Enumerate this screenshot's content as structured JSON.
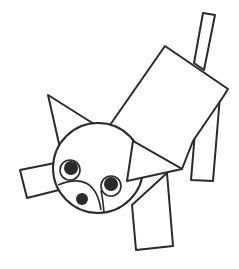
{
  "figure": {
    "colors": {
      "stroke": "#2b2b2b",
      "background": "#ffffff",
      "pupil": "#2b2b2b"
    },
    "shapes": {
      "tail": "203,13 215,15 204,70 194,63",
      "body": "165,46 228,89 223,97 193,141 182,169 133,141 110,125",
      "back_leg": "198,96 220,96 213,181 191,180",
      "front_leg": "132,205 167,173 173,246 136,250",
      "left_leg": "20,170 55,163 59,190 27,198",
      "left_ear": "48,95 94,124 60,148",
      "right_ear": "133,141 182,169 127,181",
      "head": {
        "cx": 98,
        "cy": 168,
        "r": 45
      },
      "left_eye": {
        "cx": 70,
        "cy": 170,
        "r": 10,
        "pupil_r": 7
      },
      "right_eye": {
        "cx": 111,
        "cy": 186,
        "r": 10,
        "pupil_r": 7
      },
      "nostril": {
        "cx": 82,
        "cy": 199,
        "r": 6
      }
    }
  }
}
